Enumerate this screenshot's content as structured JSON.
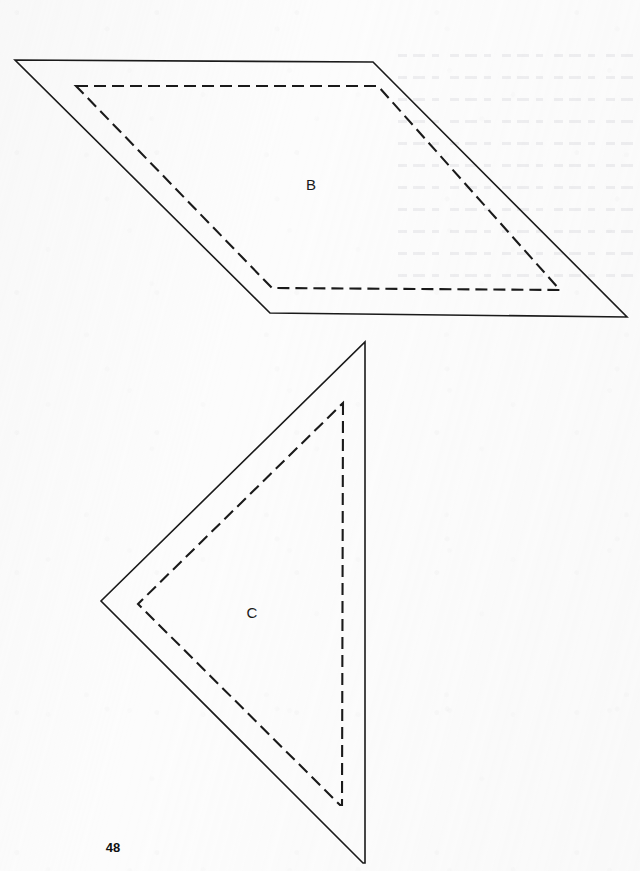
{
  "page": {
    "number": "48",
    "background_color": "#fcfcfc",
    "ink_color": "#1a1a1a",
    "width": 640,
    "height": 871
  },
  "figures": [
    {
      "id": "figure-b",
      "label": "B",
      "shape": "parallelogram",
      "label_position": {
        "x": 311,
        "y": 184
      },
      "solid_outline": {
        "stroke": "#1a1a1a",
        "stroke_width": 1.6,
        "points": "15,60 373,62 627,317 270,313"
      },
      "dashed_outline": {
        "stroke": "#1a1a1a",
        "stroke_width": 2.1,
        "dash_pattern": "12 6",
        "points": "76,86 378,86 560,290 272,288"
      }
    },
    {
      "id": "figure-c",
      "label": "C",
      "shape": "triangle",
      "label_position": {
        "x": 252,
        "y": 612
      },
      "solid_outline": {
        "stroke": "#1a1a1a",
        "stroke_width": 1.6,
        "points": "365,342 365,863 363,863 101,601"
      },
      "dashed_outline": {
        "stroke": "#1a1a1a",
        "stroke_width": 2.1,
        "dash_pattern": "12 6",
        "points": "343,403 342,805 340,805 138,604"
      }
    }
  ],
  "page_number_position": {
    "x": 113,
    "y": 847
  }
}
